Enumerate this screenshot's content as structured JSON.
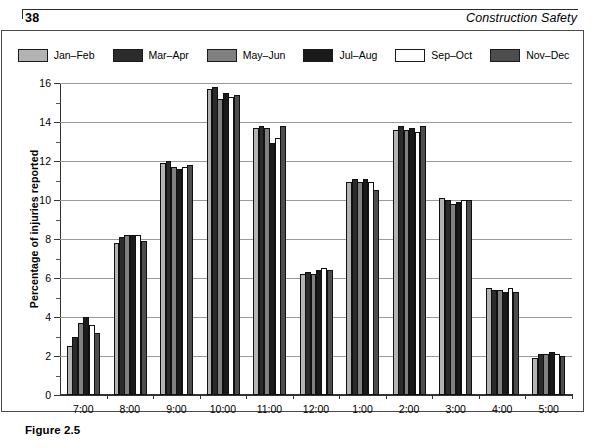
{
  "header": {
    "page_number": "38",
    "running_head": "Construction Safety"
  },
  "caption": {
    "label": "Figure 2.5"
  },
  "chart_data": {
    "type": "bar",
    "title": "",
    "xlabel": "",
    "ylabel": "Percentage of injuries reported",
    "ylim": [
      0,
      16
    ],
    "ytick_major": [
      0,
      2,
      4,
      6,
      8,
      10,
      12,
      14,
      16
    ],
    "ytick_minor": [
      1,
      3,
      5,
      7,
      9,
      11,
      13,
      15
    ],
    "ytick_labels": [
      "0",
      "2",
      "4",
      "6",
      "8",
      "10",
      "12",
      "14",
      "16"
    ],
    "grid": true,
    "legend_position": "top-center",
    "categories": [
      "7:00",
      "8:00",
      "9:00",
      "10:00",
      "11:00",
      "12:00",
      "1:00",
      "2:00",
      "3:00",
      "4:00",
      "5:00"
    ],
    "series": [
      {
        "name": "Jan–Feb",
        "color": "#b3b3b3",
        "values": [
          2.5,
          7.8,
          11.9,
          15.7,
          13.7,
          6.2,
          10.9,
          13.6,
          10.1,
          5.5,
          1.9
        ]
      },
      {
        "name": "Mar–Apr",
        "color": "#2b2b2b",
        "values": [
          3.0,
          8.1,
          12.0,
          15.8,
          13.8,
          6.3,
          11.1,
          13.8,
          10.0,
          5.4,
          2.1
        ]
      },
      {
        "name": "May–Jun",
        "color": "#808080",
        "values": [
          3.7,
          8.2,
          11.7,
          15.2,
          13.7,
          6.2,
          10.9,
          13.6,
          9.8,
          5.4,
          2.1
        ]
      },
      {
        "name": "Jul–Aug",
        "color": "#1a1a1a",
        "values": [
          4.0,
          8.2,
          11.6,
          15.5,
          12.9,
          6.4,
          11.1,
          13.7,
          9.9,
          5.3,
          2.2
        ]
      },
      {
        "name": "Sep–Oct",
        "color": "#ffffff",
        "values": [
          3.6,
          8.2,
          11.7,
          15.3,
          13.2,
          6.5,
          10.9,
          13.5,
          10.0,
          5.5,
          2.1
        ]
      },
      {
        "name": "Nov–Dec",
        "color": "#4d4d4d",
        "values": [
          3.2,
          7.9,
          11.8,
          15.4,
          13.8,
          6.4,
          10.5,
          13.8,
          10.0,
          5.3,
          2.0
        ]
      }
    ]
  }
}
